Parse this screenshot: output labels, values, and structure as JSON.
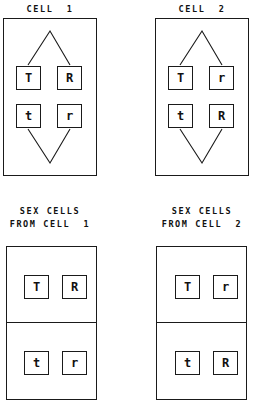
{
  "figure": {
    "background_color": "#ffffff",
    "line_color": "#1a1a1a",
    "text_color": "#111111"
  },
  "panels": {
    "cell1": {
      "title": "CELL  1",
      "alleles": {
        "top_left": "T",
        "top_right": "R",
        "bottom_left": "t",
        "bottom_right": "r"
      }
    },
    "cell2": {
      "title": "CELL  2",
      "alleles": {
        "top_left": "T",
        "top_right": "r",
        "bottom_left": "t",
        "bottom_right": "R"
      }
    },
    "sexcells1": {
      "title_line1": "SEX CELLS",
      "title_line2": "FROM CELL  1",
      "upper": {
        "left": "T",
        "right": "R"
      },
      "lower": {
        "left": "t",
        "right": "r"
      }
    },
    "sexcells2": {
      "title_line1": "SEX CELLS",
      "title_line2": "FROM CELL  2",
      "upper": {
        "left": "T",
        "right": "r"
      },
      "lower": {
        "left": "t",
        "right": "R"
      }
    }
  }
}
